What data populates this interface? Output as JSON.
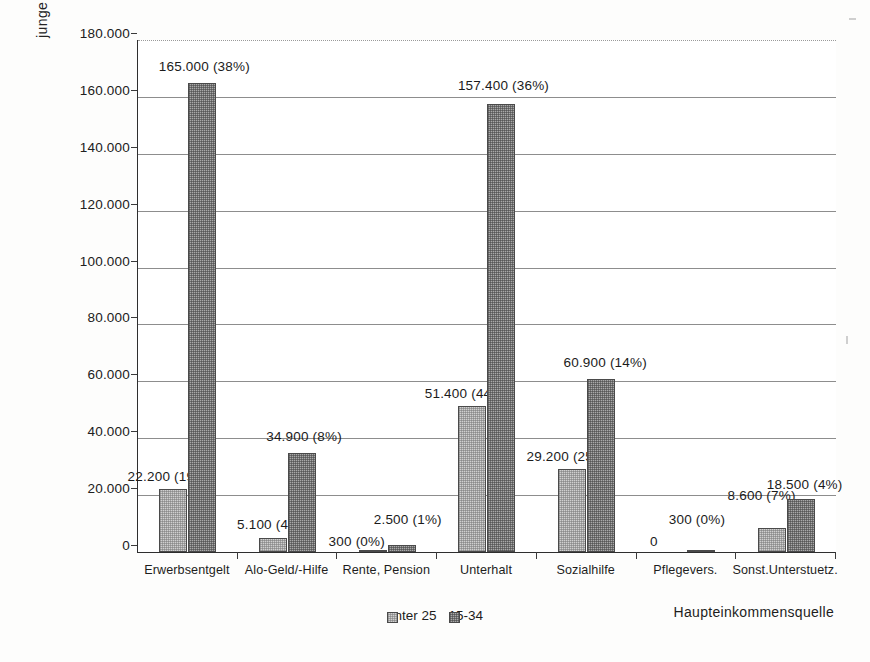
{
  "chart_data": {
    "type": "bar",
    "title": "",
    "xlabel": "Haupteinkommensquelle",
    "ylabel": "junge Mütter",
    "ylim": [
      0,
      180000
    ],
    "ytick_labels": [
      "0",
      "20.000",
      "40.000",
      "60.000",
      "80.000",
      "100.000",
      "120.000",
      "140.000",
      "160.000",
      "180.000"
    ],
    "ytick_values": [
      0,
      20000,
      40000,
      60000,
      80000,
      100000,
      120000,
      140000,
      160000,
      180000
    ],
    "grid": "horizontal",
    "legend_position": "bottom-center",
    "categories": [
      "Erwerbsentgelt",
      "Alo-Geld/-Hilfe",
      "Rente, Pension",
      "Unterhalt",
      "Sozialhilfe",
      "Pflegevers.",
      "Sonst.Unterstuetz."
    ],
    "series": [
      {
        "name": "unter 25",
        "color": "#d0d0d0",
        "values": [
          22200,
          5100,
          300,
          51400,
          29200,
          0,
          8600
        ],
        "percents": [
          "19%",
          "4%",
          "0%",
          "44%",
          "25%",
          "",
          "7%"
        ],
        "labels": [
          "22.200 (19%)",
          "5.100 (4%)",
          "300 (0%)",
          "51.400 (44%)",
          "29.200 (25%)",
          "0",
          "8.600 (7%)"
        ]
      },
      {
        "name": "15-34",
        "color": "#a9a9a9",
        "values": [
          165000,
          34900,
          2500,
          157400,
          60900,
          300,
          18500
        ],
        "percents": [
          "38%",
          "8%",
          "1%",
          "36%",
          "14%",
          "0%",
          "4%"
        ],
        "labels": [
          "165.000 (38%)",
          "34.900 (8%)",
          "2.500 (1%)",
          "157.400 (36%)",
          "60.900 (14%)",
          "300 (0%)",
          "18.500 (4%)"
        ]
      }
    ]
  },
  "axis": {
    "y_title": "junge Mütter",
    "x_title": "Haupteinkommensquelle"
  },
  "legend": {
    "items": [
      {
        "label": "unter 25"
      },
      {
        "label": "15-34"
      }
    ]
  },
  "yticks": [
    {
      "label": "180.000"
    },
    {
      "label": "160.000"
    },
    {
      "label": "140.000"
    },
    {
      "label": "120.000"
    },
    {
      "label": "100.000"
    },
    {
      "label": "80.000"
    },
    {
      "label": "60.000"
    },
    {
      "label": "40.000"
    },
    {
      "label": "20.000"
    },
    {
      "label": "0"
    }
  ],
  "xcats": [
    {
      "label": "Erwerbsentgelt"
    },
    {
      "label": "Alo-Geld/-Hilfe"
    },
    {
      "label": "Rente, Pension"
    },
    {
      "label": "Unterhalt"
    },
    {
      "label": "Sozialhilfe"
    },
    {
      "label": "Pflegevers."
    },
    {
      "label": "Sonst.Unterstuetz."
    }
  ],
  "labels": {
    "g0s0": "22.200 (19%)",
    "g0s1": "165.000 (38%)",
    "g1s0": "5.100 (4%)",
    "g1s1": "34.900 (8%)",
    "g2s0": "300 (0%)",
    "g2s1": "2.500 (1%)",
    "g3s0": "51.400 (44%)",
    "g3s1": "157.400 (36%)",
    "g4s0": "29.200 (25%)",
    "g4s1": "60.900 (14%)",
    "g5s0": "0",
    "g5s1": "300 (0%)",
    "g6s0": "8.600 (7%)",
    "g6s1": "18.500 (4%)"
  }
}
